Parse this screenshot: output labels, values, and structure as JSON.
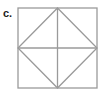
{
  "figure": {
    "label": "c.",
    "shape": "square-with-inscribed-diamond-and-cross",
    "stroke_color": "#9a9a9a",
    "square": {
      "x": 18,
      "y": 8,
      "width": 79,
      "height": 80
    },
    "lines": [
      {
        "name": "vertical-midline",
        "x1": 57.5,
        "y1": 8,
        "x2": 57.5,
        "y2": 88
      },
      {
        "name": "horizontal-midline",
        "x1": 18,
        "y1": 48,
        "x2": 97,
        "y2": 48
      }
    ],
    "diamond": [
      [
        57.5,
        8
      ],
      [
        97,
        48
      ],
      [
        57.5,
        88
      ],
      [
        18,
        48
      ]
    ]
  }
}
